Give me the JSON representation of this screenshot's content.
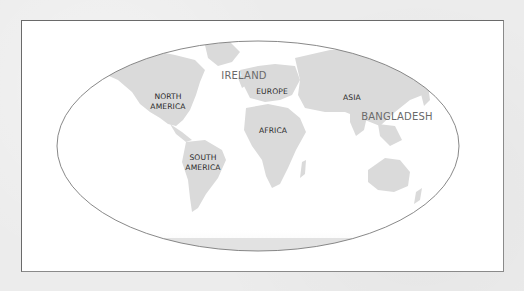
{
  "map": {
    "projection": "elliptical world map",
    "colors": {
      "page_background": "#ececec",
      "frame_background": "#ffffff",
      "frame_border": "#6a6a6a",
      "ellipse_outline": "#7a7a7a",
      "land": "#d9d9d9",
      "region_label": "#2a2a2a",
      "country_label": "#6a6a6a"
    },
    "regions": [
      {
        "id": "north-america",
        "line1": "NORTH",
        "line2": "AMERICA"
      },
      {
        "id": "south-america",
        "line1": "SOUTH",
        "line2": "AMERICA"
      },
      {
        "id": "europe",
        "line1": "EUROPE"
      },
      {
        "id": "africa",
        "line1": "AFRICA"
      },
      {
        "id": "asia",
        "line1": "ASIA"
      }
    ],
    "countries": [
      {
        "id": "ireland",
        "label": "IRELAND"
      },
      {
        "id": "bangladesh",
        "label": "BANGLADESH"
      }
    ]
  }
}
